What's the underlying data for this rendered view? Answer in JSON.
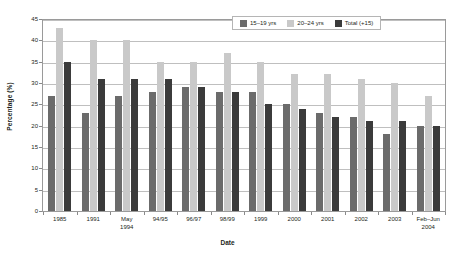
{
  "chart_data": {
    "type": "bar",
    "title": "",
    "xlabel": "Date",
    "ylabel": "Percentage (%)",
    "ylim": [
      0,
      45
    ],
    "yticks": [
      0,
      5,
      10,
      15,
      20,
      25,
      30,
      35,
      40,
      45
    ],
    "grid": true,
    "legend_position": "top-right",
    "categories": [
      "1985",
      "1991",
      "May\n1994",
      "94/95",
      "96/97",
      "98/99",
      "1999",
      "2000",
      "2001",
      "2002",
      "2003",
      "Feb–Jun\n2004"
    ],
    "category_labels": [
      {
        "line1": "1985",
        "line2": ""
      },
      {
        "line1": "1991",
        "line2": ""
      },
      {
        "line1": "May",
        "line2": "1994"
      },
      {
        "line1": "94/95",
        "line2": ""
      },
      {
        "line1": "96/97",
        "line2": ""
      },
      {
        "line1": "98/99",
        "line2": ""
      },
      {
        "line1": "1999",
        "line2": ""
      },
      {
        "line1": "2000",
        "line2": ""
      },
      {
        "line1": "2001",
        "line2": ""
      },
      {
        "line1": "2002",
        "line2": ""
      },
      {
        "line1": "2003",
        "line2": ""
      },
      {
        "line1": "Feb–Jun",
        "line2": "2004"
      }
    ],
    "series": [
      {
        "name": "15–19 yrs",
        "color": "#6b6b6b",
        "values": [
          27,
          23,
          27,
          28,
          29,
          28,
          28,
          25,
          23,
          22,
          18,
          20
        ]
      },
      {
        "name": "20–24 yrs",
        "color": "#c9c9c9",
        "values": [
          43,
          40,
          40,
          35,
          35,
          37,
          35,
          32,
          32,
          31,
          30,
          27
        ]
      },
      {
        "name": "Total (+15)",
        "color": "#3b3b3b",
        "values": [
          35,
          31,
          31,
          31,
          29,
          28,
          25,
          24,
          22,
          21,
          21,
          20
        ]
      }
    ]
  },
  "legend": {
    "items": [
      {
        "label": "15–19 yrs"
      },
      {
        "label": "20–24 yrs"
      },
      {
        "label": "Total (+15)"
      }
    ]
  },
  "axes": {
    "y_title": "Percentage (%)",
    "x_title": "Date"
  }
}
